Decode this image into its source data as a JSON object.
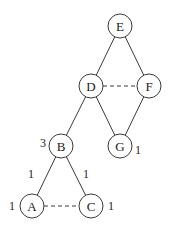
{
  "diagram": {
    "type": "tree",
    "nodes": [
      {
        "id": "E",
        "label": "E",
        "x": 120,
        "y": 26
      },
      {
        "id": "D",
        "label": "D",
        "x": 91,
        "y": 86
      },
      {
        "id": "F",
        "label": "F",
        "x": 149,
        "y": 86
      },
      {
        "id": "B",
        "label": "B",
        "x": 61,
        "y": 146
      },
      {
        "id": "G",
        "label": "G",
        "x": 120,
        "y": 146
      },
      {
        "id": "A",
        "label": "A",
        "x": 32,
        "y": 206
      },
      {
        "id": "C",
        "label": "C",
        "x": 91,
        "y": 206
      }
    ],
    "edges": [
      {
        "from": "E",
        "to": "D",
        "style": "solid"
      },
      {
        "from": "E",
        "to": "F",
        "style": "solid"
      },
      {
        "from": "D",
        "to": "F",
        "style": "dashed"
      },
      {
        "from": "D",
        "to": "B",
        "style": "solid"
      },
      {
        "from": "D",
        "to": "G",
        "style": "solid"
      },
      {
        "from": "F",
        "to": "G",
        "style": "solid"
      },
      {
        "from": "B",
        "to": "A",
        "style": "solid",
        "label": "1"
      },
      {
        "from": "B",
        "to": "C",
        "style": "solid",
        "label": "1"
      },
      {
        "from": "A",
        "to": "C",
        "style": "dashed"
      }
    ],
    "annotations": [
      {
        "text": "3",
        "near": "B",
        "x": 43,
        "y": 143
      },
      {
        "text": "1",
        "near": "G",
        "x": 138,
        "y": 150
      },
      {
        "text": "1",
        "near": "edge B-A",
        "x": 31,
        "y": 174
      },
      {
        "text": "1",
        "near": "edge B-C",
        "x": 86,
        "y": 174
      },
      {
        "text": "1",
        "near": "A",
        "x": 12,
        "y": 206
      },
      {
        "text": "1",
        "near": "C",
        "x": 111,
        "y": 206
      }
    ],
    "node_radius": 12,
    "colors": {
      "stroke": "#3a3a3a",
      "text": "#222222",
      "background": "#ffffff"
    }
  }
}
